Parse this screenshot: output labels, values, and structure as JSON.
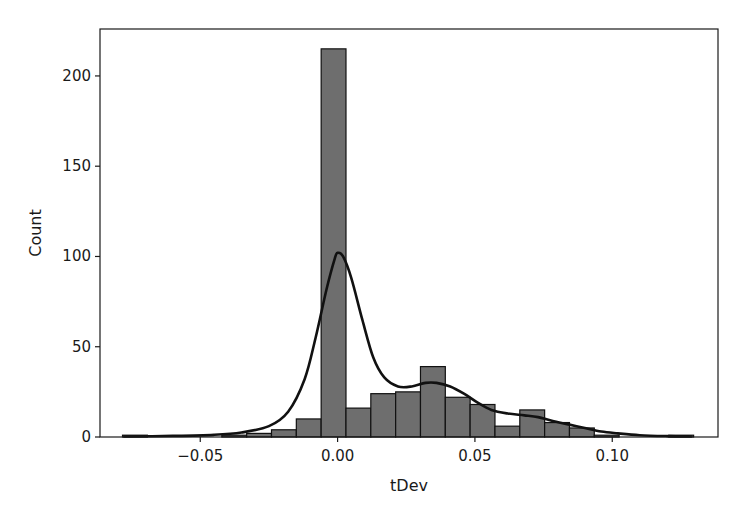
{
  "chart_data": {
    "type": "bar",
    "subtype": "histogram_with_kde",
    "title": "",
    "xlabel": "tDev",
    "ylabel": "Count",
    "xlim": [
      -0.0865,
      0.1385
    ],
    "ylim": [
      0,
      226
    ],
    "grid": false,
    "legend": null,
    "x_ticks": [
      -0.05,
      0.0,
      0.05,
      0.1
    ],
    "x_tick_labels": [
      "−0.05",
      "0.00",
      "0.05",
      "0.10"
    ],
    "y_ticks": [
      0,
      50,
      100,
      150,
      200
    ],
    "y_tick_labels": [
      "0",
      "50",
      "100",
      "150",
      "200"
    ],
    "bin_width": 0.00904,
    "bin_start": -0.0783,
    "categories": [
      "-0.0738",
      "-0.0647",
      "-0.0557",
      "-0.0467",
      "-0.0376",
      "-0.0286",
      "-0.0195",
      "-0.0105",
      "-0.0014",
      "0.0076",
      "0.0166",
      "0.0257",
      "0.0347",
      "0.0438",
      "0.0528",
      "0.0619",
      "0.0709",
      "0.0799",
      "0.0890",
      "0.0980",
      "0.1071",
      "0.1161",
      "0.1252"
    ],
    "values": [
      1,
      0,
      0,
      0,
      1,
      2,
      4,
      10,
      215,
      16,
      24,
      25,
      39,
      22,
      18,
      6,
      15,
      8,
      5,
      1,
      0,
      0,
      1
    ],
    "kde": {
      "x": [
        -0.078,
        -0.06,
        -0.045,
        -0.035,
        -0.025,
        -0.018,
        -0.012,
        -0.008,
        -0.004,
        -0.001,
        0.0,
        0.002,
        0.005,
        0.009,
        0.013,
        0.017,
        0.022,
        0.027,
        0.032,
        0.036,
        0.041,
        0.046,
        0.051,
        0.056,
        0.062,
        0.068,
        0.073,
        0.078,
        0.084,
        0.09,
        0.096,
        0.102,
        0.11,
        0.12,
        0.129
      ],
      "y": [
        0.3,
        0.6,
        1.2,
        2.5,
        6,
        14,
        32,
        55,
        82,
        99,
        102,
        100,
        88,
        65,
        44,
        33,
        28,
        28,
        30,
        30,
        28,
        24,
        19,
        15,
        13,
        12,
        11,
        9,
        7,
        5,
        3,
        2,
        1,
        0.5,
        0.3
      ]
    },
    "colors": {
      "bar_fill": "#6e6e6e",
      "bar_edge": "#111111",
      "kde_line": "#111111",
      "axes": "#1a1a1a"
    }
  }
}
